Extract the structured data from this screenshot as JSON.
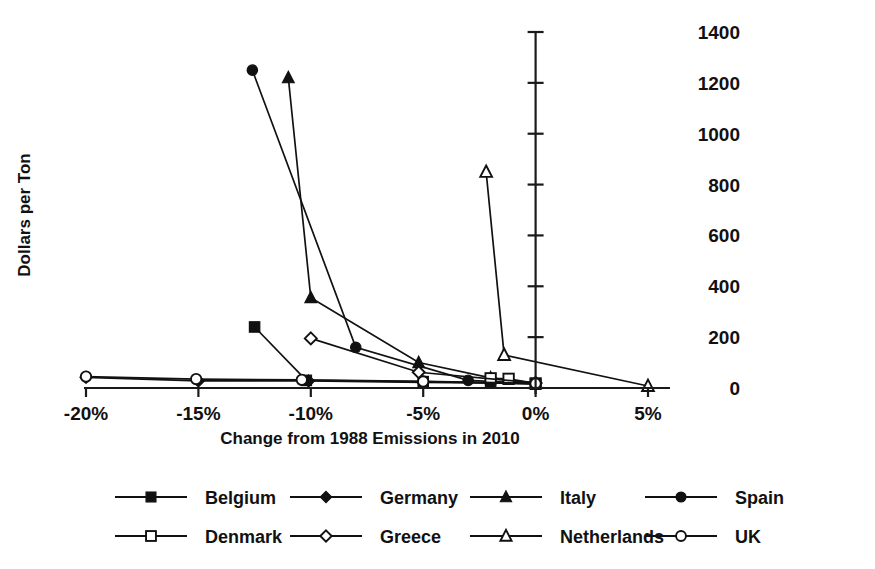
{
  "chart_data": {
    "type": "line",
    "title": "",
    "xlabel": "Change from 1988 Emissions in 2010",
    "ylabel": "Dollars per Ton",
    "xlim": [
      -21.5,
      6.5
    ],
    "ylim": [
      0,
      1450
    ],
    "xticks": [
      -20,
      -15,
      -10,
      -5,
      0,
      5
    ],
    "xtick_labels": [
      "-20%",
      "-15%",
      "-10%",
      "-5%",
      "0%",
      "5%"
    ],
    "yticks": [
      0,
      200,
      400,
      600,
      800,
      1000,
      1200,
      1400
    ],
    "ytick_labels": [
      "0",
      "200",
      "400",
      "600",
      "800",
      "1000",
      "1200",
      "1400"
    ],
    "y_axis_position": "zero-percent-vertical",
    "ytick_label_position": "right",
    "grid": false,
    "legend_position": "bottom",
    "legend_columns": 4,
    "series": [
      {
        "name": "Belgium",
        "marker": "filled-square",
        "x": [
          -12.5,
          -10.2,
          -5.0,
          -2.0,
          0.0
        ],
        "y": [
          240,
          30,
          25,
          20,
          15
        ]
      },
      {
        "name": "Germany",
        "marker": "filled-diamond",
        "x": [
          -20.0,
          -15.0,
          -10.1,
          -5.0,
          0.0
        ],
        "y": [
          42,
          28,
          28,
          22,
          18
        ]
      },
      {
        "name": "Italy",
        "marker": "filled-triangle",
        "x": [
          -11.0,
          -10.0,
          -5.2,
          -2.0,
          0.0
        ],
        "y": [
          1220,
          355,
          100,
          40,
          18
        ]
      },
      {
        "name": "Spain",
        "marker": "filled-circle",
        "x": [
          -12.6,
          -8.0,
          -3.0,
          0.0
        ],
        "y": [
          1250,
          160,
          30,
          18
        ]
      },
      {
        "name": "Denmark",
        "marker": "open-square",
        "x": [
          -2.0,
          -1.2,
          0.0
        ],
        "y": [
          38,
          36,
          18
        ]
      },
      {
        "name": "Greece",
        "marker": "open-diamond",
        "x": [
          -10.0,
          -5.2,
          0.0
        ],
        "y": [
          195,
          62,
          20
        ]
      },
      {
        "name": "Netherlands",
        "marker": "open-triangle",
        "x": [
          -2.2,
          -1.4,
          5.0
        ],
        "y": [
          850,
          130,
          8
        ]
      },
      {
        "name": "UK",
        "marker": "open-circle",
        "x": [
          -20.0,
          -15.1,
          -10.4,
          -5.0,
          0.0
        ],
        "y": [
          45,
          35,
          32,
          26,
          18
        ]
      }
    ]
  },
  "legend": {
    "entries": [
      {
        "label": "Belgium",
        "marker": "filled-square"
      },
      {
        "label": "Germany",
        "marker": "filled-diamond"
      },
      {
        "label": "Italy",
        "marker": "filled-triangle"
      },
      {
        "label": "Spain",
        "marker": "filled-circle"
      },
      {
        "label": "Denmark",
        "marker": "open-square"
      },
      {
        "label": "Greece",
        "marker": "open-diamond"
      },
      {
        "label": "Netherlands",
        "marker": "open-triangle"
      },
      {
        "label": "UK",
        "marker": "open-circle"
      }
    ]
  },
  "colors": {
    "ink": "#111111",
    "background": "#ffffff"
  }
}
